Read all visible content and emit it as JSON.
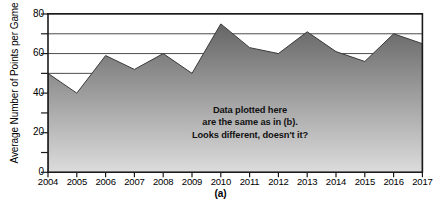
{
  "figure": {
    "panel_label": "(a)",
    "annotation_lines": [
      "Data plotted here",
      "are the same as in (b).",
      "Looks different, doesn't it?"
    ],
    "colors": {
      "area_top": "#6b6b6b",
      "area_bottom": "#d6d6d6",
      "axis": "#1a1a1a",
      "grid": "#555555",
      "text": "#000000"
    }
  },
  "chart_data": {
    "type": "area",
    "title": "",
    "subtitle": "",
    "xlabel": "",
    "ylabel": "Average Number of Points per Game",
    "categories": [
      "2004",
      "2005",
      "2006",
      "2007",
      "2008",
      "2009",
      "2010",
      "2011",
      "2012",
      "2013",
      "2014",
      "2015",
      "2016",
      "2017"
    ],
    "values": [
      50,
      40,
      59,
      52,
      60,
      50,
      75,
      63,
      60,
      71,
      61,
      56,
      70,
      65
    ],
    "ylim": [
      0,
      80
    ],
    "ytick_major": [
      0,
      20,
      40,
      60,
      80
    ],
    "ytick_minor": [
      10,
      30,
      50,
      70
    ],
    "gridlines": [
      50,
      60,
      70,
      80
    ],
    "grid": true,
    "legend": "none",
    "annotation": "Data plotted here are the same as in (b). Looks different, doesn't it?"
  },
  "y_axis_labels": [
    "80",
    "60",
    "40",
    "20",
    "0"
  ],
  "x_axis_labels": [
    "2004",
    "2005",
    "2006",
    "2007",
    "2008",
    "2009",
    "2010",
    "2011",
    "2012",
    "2013",
    "2014",
    "2015",
    "2016",
    "2017"
  ]
}
